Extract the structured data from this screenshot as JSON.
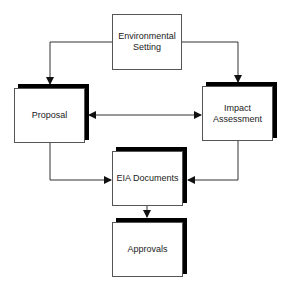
{
  "diagram": {
    "nodes": [
      {
        "id": "env",
        "label": "Environmental Setting",
        "line1": "Environmental",
        "line2": "Setting",
        "shadow": false
      },
      {
        "id": "proposal",
        "label": "Proposal",
        "shadow": true
      },
      {
        "id": "impact",
        "label": "Impact Assessment",
        "line1": "Impact",
        "line2": "Assessment",
        "shadow": true
      },
      {
        "id": "eia",
        "label": "EIA Documents",
        "shadow": true
      },
      {
        "id": "approvals",
        "label": "Approvals",
        "shadow": true
      }
    ],
    "edges": [
      {
        "from": "env",
        "to": "proposal",
        "type": "directed"
      },
      {
        "from": "env",
        "to": "impact",
        "type": "directed"
      },
      {
        "from": "proposal",
        "to": "impact",
        "type": "bidirectional"
      },
      {
        "from": "proposal",
        "to": "eia",
        "type": "directed"
      },
      {
        "from": "impact",
        "to": "eia",
        "type": "directed"
      },
      {
        "from": "eia",
        "to": "approvals",
        "type": "directed"
      }
    ],
    "colors": {
      "line": "#333333",
      "shadow": "#000000",
      "box_border": "#555555",
      "background": "#ffffff"
    }
  }
}
